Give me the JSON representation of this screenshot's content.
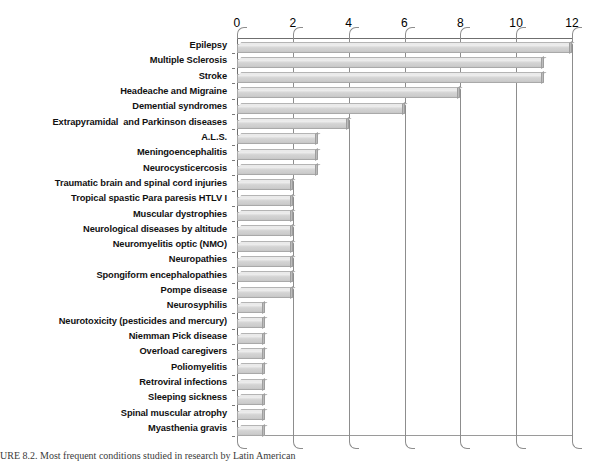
{
  "chart_data": {
    "type": "bar",
    "orientation": "horizontal",
    "title": "",
    "subtitle": "",
    "xlabel": "",
    "ylabel": "",
    "xlim": [
      0,
      12
    ],
    "xticks": [
      0,
      2,
      4,
      6,
      8,
      10,
      12
    ],
    "grid": true,
    "legend": null,
    "axis_position": "top",
    "style_3d": true,
    "bar_color": "#d3d3d3",
    "bar_border_color": "#a9a9a9",
    "categories": [
      "Epilepsy",
      "Multiple Sclerosis",
      "Stroke",
      "Headeache and Migraine",
      "Demential syndromes",
      "Extrapyramidal  and Parkinson diseases",
      "A.L.S.",
      "Meningoencephalitis",
      "Neurocysticercosis",
      "Traumatic brain and spinal cord injuries",
      "Tropical spastic Para paresis HTLV I",
      "Muscular dystrophies",
      "Neurological diseases by altitude",
      "Neuromyelitis optic (NMO)",
      "Neuropathies",
      "Spongiform encephalopathies",
      "Pompe disease",
      "Neurosyphilis",
      "Neurotoxicity (pesticides and mercury)",
      "Niemman Pick disease",
      "Overload caregivers",
      "Poliomyelitis",
      "Retroviral infections",
      "Sleeping sickness",
      "Spinal muscular atrophy",
      "Myasthenia gravis"
    ],
    "values": [
      12,
      11,
      11,
      8,
      6,
      4,
      2.9,
      2.9,
      2.9,
      2,
      2,
      2,
      2,
      2,
      2,
      2,
      2,
      1,
      1,
      1,
      1,
      1,
      1,
      1,
      1,
      1
    ]
  },
  "caption": {
    "text": "URE 8.2.  Most frequent conditions studied in research by Latin American"
  }
}
